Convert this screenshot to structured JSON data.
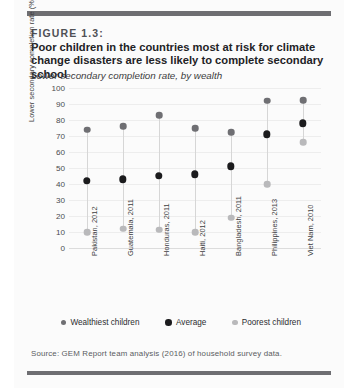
{
  "figure": {
    "number_label": "FIGURE 1.3:",
    "title": "Poor children in the countries most at risk for climate change disasters are less likely to complete secondary school",
    "subtitle": "Lower secondary completion rate, by wealth",
    "source": "Source: GEM Report team analysis (2016) of household survey data."
  },
  "legend": {
    "items": [
      {
        "label": "Wealthiest children",
        "color": "#6f6f73",
        "key": "wealthiest"
      },
      {
        "label": "Average",
        "color": "#1b1b1d",
        "key": "average"
      },
      {
        "label": "Poorest children",
        "color": "#b9b9bb",
        "key": "poorest"
      }
    ]
  },
  "chart_data": {
    "type": "scatter",
    "title": "Poor children in the countries most at risk for climate change disasters are less likely to complete secondary school",
    "subtitle": "Lower secondary completion rate, by wealth",
    "xlabel": "",
    "ylabel": "Lower secondary completion rate (%)",
    "ylim": [
      0,
      100
    ],
    "yticks": [
      0,
      10,
      20,
      30,
      40,
      50,
      60,
      70,
      80,
      90,
      100
    ],
    "grid": true,
    "legend_position": "bottom",
    "categories": [
      "Pakistan, 2012",
      "Guatemala, 2011",
      "Honduras, 2011",
      "Haiti, 2012",
      "Bangladesh, 2011",
      "Philippines, 2013",
      "Viet Nam, 2010"
    ],
    "series": [
      {
        "name": "Wealthiest children",
        "color": "#6f6f73",
        "values": [
          74,
          76,
          83,
          75,
          72.5,
          92,
          92.5
        ]
      },
      {
        "name": "Average",
        "color": "#1b1b1d",
        "values": [
          42,
          43,
          45,
          46,
          51,
          71,
          78
        ]
      },
      {
        "name": "Poorest children",
        "color": "#b9b9bb",
        "values": [
          10,
          12,
          11.5,
          10,
          19,
          40,
          66
        ]
      }
    ]
  }
}
